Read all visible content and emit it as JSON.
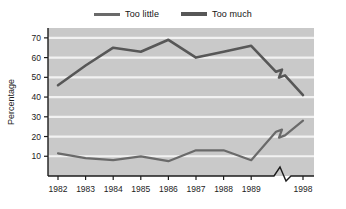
{
  "chart_data": {
    "type": "line",
    "title": "",
    "subtitle": "",
    "xlabel": "",
    "ylabel": "Percentage",
    "x": [
      "1982",
      "1983",
      "1984",
      "1985",
      "1986",
      "1987",
      "1988",
      "1989",
      "1998"
    ],
    "axis_break": {
      "present": true,
      "between": [
        "1989",
        "1998"
      ],
      "style": "zigzag",
      "note": "x-axis and both series are interrupted by a zigzag break between 1989 and 1998"
    },
    "xlim": [
      1982,
      1998
    ],
    "ylim": [
      0,
      75
    ],
    "y_ticks": [
      10,
      20,
      30,
      40,
      50,
      60,
      70
    ],
    "x_ticks": [
      "1982",
      "1983",
      "1984",
      "1985",
      "1986",
      "1987",
      "1988",
      "1989",
      "1998"
    ],
    "grid": "horizontal",
    "legend_position": "top-center",
    "plot_background": "#c9c9c9",
    "gridline_color": "#f2f2f2",
    "series": [
      {
        "name": "Too little",
        "color": "#6a6a6a",
        "width": 2.2,
        "values": [
          11.5,
          9,
          8,
          10,
          7.5,
          13,
          13,
          8,
          28
        ]
      },
      {
        "name": "Too much",
        "color": "#575757",
        "width": 2.6,
        "values": [
          46,
          56,
          65,
          63,
          69,
          60,
          63,
          66,
          41
        ]
      }
    ]
  },
  "legend": {
    "entries": [
      {
        "label": "Too little"
      },
      {
        "label": "Too much"
      }
    ]
  },
  "axes": {
    "y_title": "Percentage",
    "y_ticks": [
      "10",
      "20",
      "30",
      "40",
      "50",
      "60",
      "70"
    ],
    "x_ticks": [
      "1982",
      "1983",
      "1984",
      "1985",
      "1986",
      "1987",
      "1988",
      "1989",
      "1998"
    ]
  }
}
